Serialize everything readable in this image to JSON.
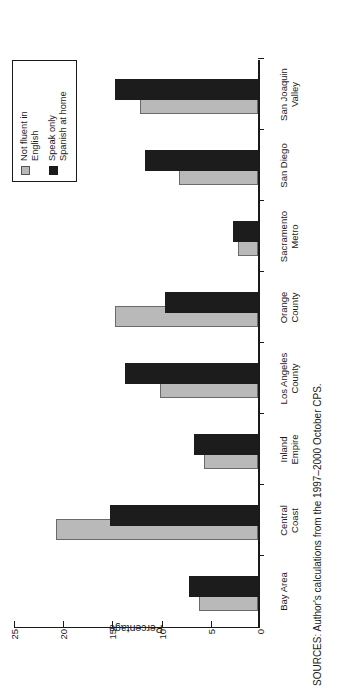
{
  "figure": {
    "source_note": "SOURCES: Author's calculations from the 1997–2000 October CPS."
  },
  "legend": {
    "entries": [
      {
        "label": "Not fluent in\nEnglish",
        "swatch": "gray-swatch-icon",
        "color": "#b9b9b9"
      },
      {
        "label": "Speak only\nSpanish at home",
        "swatch": "black-swatch-icon",
        "color": "#1c1c1c"
      }
    ]
  },
  "axes": {
    "ylabel": "Percentage",
    "yticks": [
      "0",
      "5",
      "10",
      "15",
      "20",
      "25"
    ]
  },
  "chart_data": {
    "type": "bar",
    "title": "",
    "xlabel": "",
    "ylabel": "Percentage",
    "ylim": [
      0,
      25
    ],
    "grid": false,
    "legend_position": "top-right",
    "orientation": "vertical-bars-page-rotated-90ccw",
    "categories": [
      "Bay Area",
      "Central\nCoast",
      "Inland\nEmpire",
      "Los Angeles\nCounty",
      "Orange\nCounty",
      "Sacramento\nMetro",
      "San Diego",
      "San Joaquin\nValley"
    ],
    "series": [
      {
        "name": "Not fluent in English",
        "color": "#b9b9b9",
        "values": [
          6.0,
          20.5,
          5.5,
          10.0,
          14.5,
          2.0,
          8.0,
          12.0
        ]
      },
      {
        "name": "Speak only Spanish at home",
        "color": "#1c1c1c",
        "values": [
          7.0,
          15.0,
          6.5,
          13.5,
          9.5,
          2.5,
          11.5,
          14.5
        ]
      }
    ]
  }
}
